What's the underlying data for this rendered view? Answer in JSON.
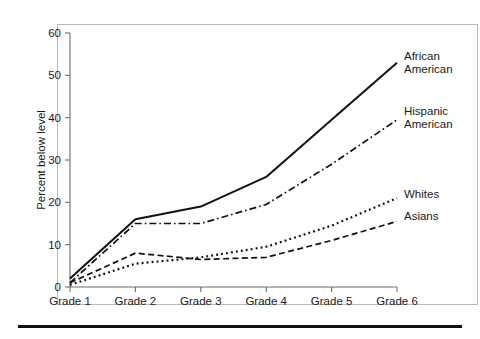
{
  "figure": {
    "frame_color": "#b9b9b9",
    "rule_color": "#111111"
  },
  "chart_data": {
    "type": "line",
    "title": "",
    "subtitle": "",
    "xlabel": "",
    "ylabel": "Percent below level",
    "categories": [
      "Grade 1",
      "Grade 2",
      "Grade 3",
      "Grade 4",
      "Grade 5",
      "Grade 6"
    ],
    "ylim": [
      0,
      60
    ],
    "yticks": [
      0,
      10,
      20,
      30,
      40,
      50,
      60
    ],
    "ytick_labels": [
      "0",
      "10",
      "20",
      "30",
      "40",
      "50",
      "60"
    ],
    "grid": false,
    "legend_position": "right-inline-labels",
    "series": [
      {
        "name": "African American",
        "label_line1": "African",
        "label_line2": "American",
        "style": "solid",
        "dash": "none",
        "width": 2.0,
        "color": "#111111",
        "values": [
          2,
          16,
          19,
          26,
          39.5,
          53
        ]
      },
      {
        "name": "Hispanic American",
        "label_line1": "Hispanic",
        "label_line2": "American",
        "style": "dash-dot",
        "dash": "7,3,1.6,3",
        "width": 1.7,
        "color": "#111111",
        "values": [
          1,
          15,
          15,
          19.5,
          29,
          39.5
        ]
      },
      {
        "name": "Whites",
        "label_line1": "Whites",
        "label_line2": "",
        "style": "dotted",
        "dash": "1.9,3.1",
        "width": 2.2,
        "color": "#111111",
        "values": [
          0.5,
          5.5,
          7,
          9.5,
          14.5,
          21
        ]
      },
      {
        "name": "Asians",
        "label_line1": "Asians",
        "label_line2": "",
        "style": "dashed",
        "dash": "6,3.4",
        "width": 1.7,
        "color": "#111111",
        "values": [
          1,
          8,
          6.5,
          7,
          11,
          15.5
        ]
      }
    ]
  }
}
